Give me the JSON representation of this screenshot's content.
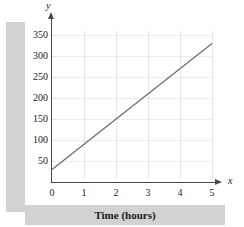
{
  "chart_data": {
    "type": "line",
    "title": "",
    "xlabel": "Time (hours)",
    "ylabel": "Distance (miles)",
    "x_axis_name": "x",
    "y_axis_name": "y",
    "xlim": [
      0,
      5.2
    ],
    "ylim": [
      0,
      365
    ],
    "xticks": [
      0,
      1,
      2,
      3,
      4,
      5
    ],
    "xtick_labels": [
      "0",
      "1",
      "2",
      "3",
      "4",
      "5"
    ],
    "yticks": [
      50,
      100,
      150,
      200,
      250,
      300,
      350
    ],
    "ytick_labels": [
      "50",
      "100",
      "150",
      "200",
      "250",
      "300",
      "350"
    ],
    "grid": true,
    "grid_horizontal_style": "dotted",
    "grid_vertical_style": "solid",
    "legend": null,
    "series": [
      {
        "name": "distance",
        "x": [
          0,
          5
        ],
        "y": [
          30,
          330
        ],
        "slope": 60,
        "intercept": 30,
        "color": "#6e6e6e"
      }
    ]
  },
  "colors": {
    "band": "#d2d2d2",
    "axis": "#4a4a4a",
    "line": "#6e6e6e",
    "grid_minor": "#dcdcdc",
    "grid_major": "#e8e8e8",
    "text": "#1a1a1a",
    "background": "#ffffff"
  }
}
